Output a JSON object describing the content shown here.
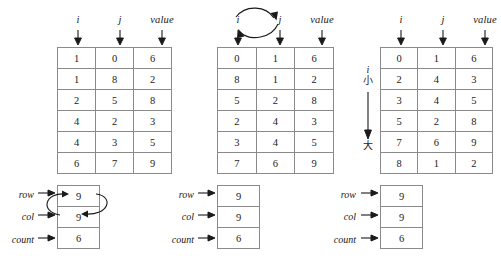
{
  "figure": {
    "background_color": "#ffffff",
    "line_color": "#8a8a8a",
    "text_color": "#1a1a1a"
  },
  "columns": {
    "i": "i",
    "j": "j",
    "value": "value"
  },
  "scalar_labels": {
    "row": "row",
    "col": "col",
    "count": "count"
  },
  "panels": [
    {
      "id": "left",
      "headers": [
        "i",
        "j",
        "value"
      ],
      "rows": [
        [
          "1",
          "0",
          "6"
        ],
        [
          "1",
          "8",
          "2"
        ],
        [
          "2",
          "5",
          "8"
        ],
        [
          "4",
          "2",
          "3"
        ],
        [
          "4",
          "3",
          "5"
        ],
        [
          "6",
          "7",
          "9"
        ]
      ],
      "scalars": {
        "row": "9",
        "col": "9",
        "count": "6"
      },
      "swap_header": false,
      "swap_scalars": true,
      "sort_note": null
    },
    {
      "id": "middle",
      "headers": [
        "i",
        "j",
        "value"
      ],
      "rows": [
        [
          "0",
          "1",
          "6"
        ],
        [
          "8",
          "1",
          "2"
        ],
        [
          "5",
          "2",
          "8"
        ],
        [
          "2",
          "4",
          "3"
        ],
        [
          "3",
          "4",
          "5"
        ],
        [
          "7",
          "6",
          "9"
        ]
      ],
      "scalars": {
        "row": "9",
        "col": "9",
        "count": "6"
      },
      "swap_header": true,
      "swap_scalars": false,
      "sort_note": null
    },
    {
      "id": "right",
      "headers": [
        "i",
        "j",
        "value"
      ],
      "rows": [
        [
          "0",
          "1",
          "6"
        ],
        [
          "2",
          "4",
          "3"
        ],
        [
          "3",
          "4",
          "5"
        ],
        [
          "5",
          "2",
          "8"
        ],
        [
          "7",
          "6",
          "9"
        ],
        [
          "8",
          "1",
          "2"
        ]
      ],
      "scalars": {
        "row": "9",
        "col": "9",
        "count": "6"
      },
      "swap_header": false,
      "swap_scalars": false,
      "sort_note": {
        "variable": "i",
        "from": "小",
        "to": "大"
      }
    }
  ]
}
